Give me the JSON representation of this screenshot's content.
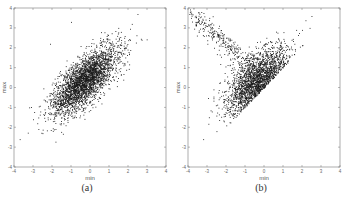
{
  "chart_data": [
    {
      "type": "scatter",
      "title": "",
      "caption": "(a)",
      "xlabel": "min",
      "ylabel": "max",
      "xlim": [
        -4,
        4
      ],
      "ylim": [
        -4,
        4
      ],
      "xticks": [
        "-4",
        "-3",
        "-2",
        "-1",
        "0",
        "1",
        "2",
        "3",
        "4"
      ],
      "yticks": [
        "-4",
        "-3",
        "-2",
        "-1",
        "0",
        "1",
        "2",
        "3",
        "4"
      ],
      "grid": false,
      "marker_color": "#1a1a1a",
      "description": "Dense correlated elliptical cloud, centered near (-0.3, 0.4), elongated along the diagonal from about (-3.7,-2.7) to (2.6,3.7)",
      "generator": {
        "n": 3000,
        "center": [
          -0.3,
          0.35
        ],
        "sd_major": 1.15,
        "sd_minor": 0.45,
        "angle_deg": 45,
        "seed": 7
      },
      "sample_points": [
        [
          -3.7,
          -2.6
        ],
        [
          -3.2,
          -1.0
        ],
        [
          -3.0,
          -1.6
        ],
        [
          -2.5,
          -2.3
        ],
        [
          -2.0,
          -1.0
        ],
        [
          -1.5,
          -0.6
        ],
        [
          -1.2,
          0.5
        ],
        [
          -1.0,
          -0.2
        ],
        [
          -0.8,
          0.8
        ],
        [
          -0.5,
          0.2
        ],
        [
          -0.3,
          0.6
        ],
        [
          0.0,
          0.9
        ],
        [
          0.3,
          1.1
        ],
        [
          0.5,
          1.6
        ],
        [
          0.8,
          1.2
        ],
        [
          1.2,
          2.1
        ],
        [
          1.5,
          1.8
        ],
        [
          1.8,
          2.5
        ],
        [
          2.2,
          3.2
        ],
        [
          2.5,
          3.7
        ],
        [
          -1.0,
          3.3
        ],
        [
          -2.1,
          2.2
        ]
      ]
    },
    {
      "type": "scatter",
      "title": "",
      "caption": "(b)",
      "xlabel": "min",
      "ylabel": "max",
      "xlim": [
        -4,
        4
      ],
      "ylim": [
        -4,
        4
      ],
      "xticks": [
        "-4",
        "-3",
        "-2",
        "-1",
        "0",
        "1",
        "2",
        "3",
        "4"
      ],
      "yticks": [
        "-4",
        "-3",
        "-2",
        "-1",
        "0",
        "1",
        "2",
        "3",
        "4"
      ],
      "grid": false,
      "marker_color": "#1a1a1a",
      "description": "V/triangular cloud bounded below by the diagonal max = min, densest near (-0.4, 0.4), with a sparse arm toward upper-left (-3.5, 3.8)",
      "generator": {
        "n": 2400,
        "center": [
          -0.4,
          0.4
        ],
        "sd_major": 1.05,
        "sd_minor": 0.5,
        "angle_deg": 45,
        "arm_fraction": 0.12,
        "seed": 11
      },
      "sample_points": [
        [
          -3.3,
          3.8
        ],
        [
          -3.6,
          3.3
        ],
        [
          -2.8,
          3.0
        ],
        [
          -2.4,
          2.6
        ],
        [
          -1.8,
          2.0
        ],
        [
          -1.3,
          1.6
        ],
        [
          -3.2,
          -2.6
        ],
        [
          -2.9,
          -1.5
        ],
        [
          -2.5,
          -2.2
        ],
        [
          -1.8,
          -1.2
        ],
        [
          -1.2,
          -0.8
        ],
        [
          -1.0,
          0.0
        ],
        [
          -0.6,
          0.5
        ],
        [
          -0.3,
          0.8
        ],
        [
          0.0,
          0.6
        ],
        [
          0.3,
          1.2
        ],
        [
          0.7,
          1.5
        ],
        [
          1.1,
          1.8
        ],
        [
          1.6,
          2.2
        ],
        [
          2.0,
          2.9
        ],
        [
          2.4,
          3.0
        ],
        [
          2.5,
          3.6
        ]
      ]
    }
  ]
}
